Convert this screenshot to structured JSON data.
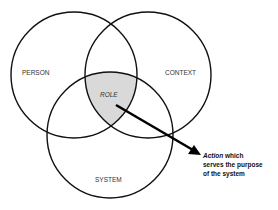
{
  "diagram": {
    "type": "venn",
    "sets": [
      {
        "id": "person",
        "label": "PERSON"
      },
      {
        "id": "context",
        "label": "CONTEXT"
      },
      {
        "id": "system",
        "label": "SYSTEM"
      }
    ],
    "intersection": {
      "label": "ROLE",
      "sets": [
        "person",
        "context",
        "system"
      ],
      "fill": "#d9d9d9"
    },
    "annotation": {
      "emphasis": "Action",
      "line1_rest": " which",
      "line2": "serves the purpose",
      "line3": "of the system"
    },
    "stroke_color": "#111111"
  }
}
